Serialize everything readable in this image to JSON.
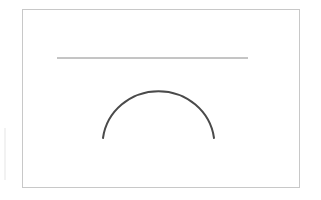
{
  "diagram": {
    "frame": {
      "x": 22.5,
      "y": 9.5,
      "width": 277,
      "height": 178,
      "stroke": "#c8c8c8"
    },
    "line": {
      "x1": 57,
      "y1": 58,
      "x2": 248,
      "y2": 58,
      "stroke": "#8a8a8a",
      "width": 1
    },
    "arc": {
      "x_start": 103,
      "y_start": 138,
      "x_end": 214,
      "y_end": 138,
      "rx": 56,
      "ry": 54,
      "stroke": "#4a4a4a",
      "width": 2
    }
  }
}
